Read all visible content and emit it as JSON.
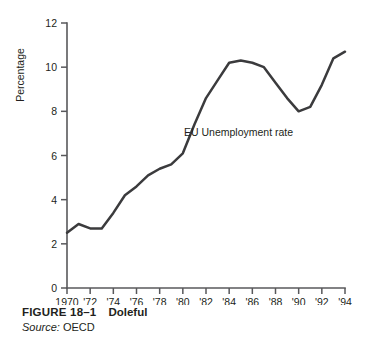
{
  "figure": {
    "number": "FIGURE 18–1",
    "title": "Doleful",
    "source_label": "Source:",
    "source_value": " OECD"
  },
  "chart_data": {
    "type": "line",
    "title": "",
    "subtitle": "",
    "xlabel": "",
    "ylabel": "Percentage",
    "xlim": [
      1970,
      1994
    ],
    "ylim": [
      0,
      12
    ],
    "grid": false,
    "legend_position": "inline-annotation",
    "annotations": [
      {
        "text": "EU Unemployment rate",
        "x": 1980.1,
        "y": 6.9
      }
    ],
    "yticks": [
      0,
      2,
      4,
      6,
      8,
      10,
      12
    ],
    "ytick_labels": [
      "0",
      "2",
      "4",
      "6",
      "8",
      "10",
      "12"
    ],
    "xticks": [
      1970,
      1972,
      1974,
      1976,
      1978,
      1980,
      1982,
      1984,
      1986,
      1988,
      1990,
      1992,
      1994
    ],
    "xtick_labels": [
      "1970",
      "'72",
      "'74",
      "'76",
      "'78",
      "'80",
      "'82",
      "'84",
      "'86",
      "'88",
      "'90",
      "'92",
      "'94"
    ],
    "series": [
      {
        "name": "EU Unemployment rate",
        "color": "#3b3b3d",
        "x": [
          1970,
          1971,
          1972,
          1973,
          1974,
          1975,
          1976,
          1977,
          1978,
          1979,
          1980,
          1981,
          1982,
          1983,
          1984,
          1985,
          1986,
          1987,
          1988,
          1989,
          1990,
          1991,
          1992,
          1993,
          1994
        ],
        "values": [
          2.5,
          2.9,
          2.7,
          2.7,
          3.4,
          4.2,
          4.6,
          5.1,
          5.4,
          5.6,
          6.1,
          7.4,
          8.6,
          9.4,
          10.2,
          10.3,
          10.2,
          10.0,
          9.3,
          8.6,
          8.0,
          8.2,
          9.2,
          10.4,
          10.7
        ]
      }
    ]
  }
}
